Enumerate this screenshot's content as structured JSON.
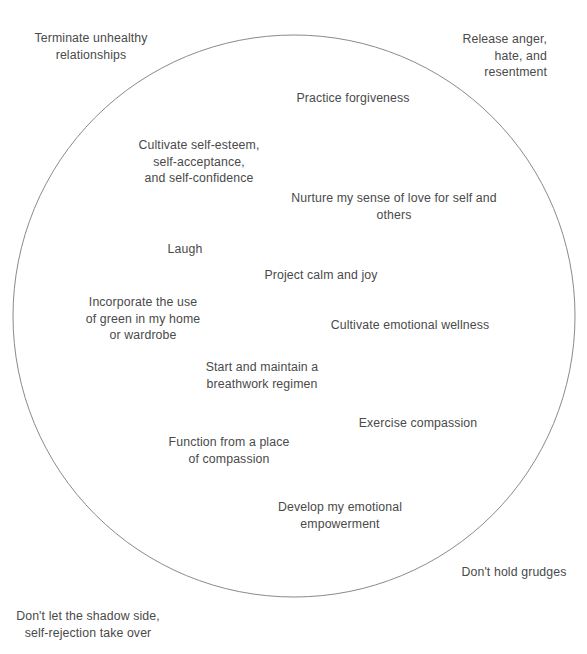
{
  "figure": {
    "type": "concept-circle-diagram",
    "background_color": "#ffffff",
    "text_color": "#4a4a4a",
    "circle": {
      "stroke_color": "#8a8a8a",
      "stroke_width": 1,
      "fill": "none",
      "center_x": 294,
      "center_y": 316,
      "radius": 281
    }
  },
  "labels": [
    {
      "id": "terminate-unhealthy-relationships",
      "text": "Terminate unhealthy\nrelationships",
      "position": "outside-top-left",
      "align": "center",
      "x": 26,
      "y": 30,
      "width": 130
    },
    {
      "id": "release-anger-hate-resentment",
      "text": "Release anger,\nhate, and\nresentment",
      "position": "outside-top-right",
      "align": "right",
      "x": 445,
      "y": 31,
      "width": 102
    },
    {
      "id": "practice-forgiveness",
      "text": "Practice forgiveness",
      "position": "inside",
      "align": "center",
      "x": 292,
      "y": 90,
      "width": 122
    },
    {
      "id": "cultivate-self-esteem",
      "text": "Cultivate self-esteem,\nself-acceptance,\nand self-confidence",
      "position": "inside",
      "align": "center",
      "x": 129,
      "y": 137,
      "width": 140
    },
    {
      "id": "nurture-my-sense-of-love",
      "text": "Nurture my sense of love for self and others",
      "position": "inside",
      "align": "center",
      "x": 276,
      "y": 190,
      "width": 236
    },
    {
      "id": "laugh",
      "text": "Laugh",
      "position": "inside",
      "align": "center",
      "x": 144,
      "y": 241,
      "width": 82
    },
    {
      "id": "project-calm-and-joy",
      "text": "Project calm and joy",
      "position": "inside",
      "align": "center",
      "x": 206,
      "y": 267,
      "width": 230
    },
    {
      "id": "incorporate-green",
      "text": "Incorporate the use\nof green in my home\nor wardrobe",
      "position": "inside",
      "align": "center",
      "x": 76,
      "y": 294,
      "width": 134
    },
    {
      "id": "cultivate-emotional-wellness",
      "text": "Cultivate emotional wellness",
      "position": "inside",
      "align": "center",
      "x": 330,
      "y": 317,
      "width": 160
    },
    {
      "id": "breathwork-regimen",
      "text": "Start and maintain a\nbreathwork regimen",
      "position": "inside",
      "align": "center",
      "x": 198,
      "y": 359,
      "width": 128
    },
    {
      "id": "exercise-compassion",
      "text": "Exercise compassion",
      "position": "inside",
      "align": "center",
      "x": 356,
      "y": 415,
      "width": 124
    },
    {
      "id": "function-from-compassion",
      "text": "Function from a place\nof compassion",
      "position": "inside",
      "align": "center",
      "x": 161,
      "y": 434,
      "width": 136
    },
    {
      "id": "develop-emotional-empowerment",
      "text": "Develop my emotional\nempowerment",
      "position": "inside",
      "align": "center",
      "x": 272,
      "y": 499,
      "width": 136
    },
    {
      "id": "dont-hold-grudges",
      "text": "Don't hold grudges",
      "position": "outside-bottom-right",
      "align": "center",
      "x": 452,
      "y": 564,
      "width": 124
    },
    {
      "id": "dont-let-shadow-side",
      "text": "Don't let the shadow side,\nself-rejection take over",
      "position": "outside-bottom-left",
      "align": "center",
      "x": 12,
      "y": 608,
      "width": 152
    }
  ]
}
